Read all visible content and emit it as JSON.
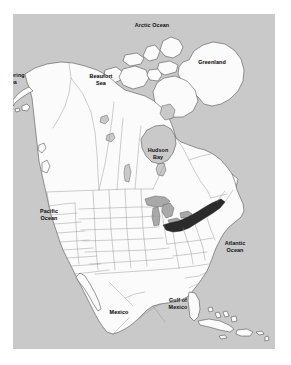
{
  "figure": {
    "kind": "reference-map",
    "highlight_region": "New York State"
  },
  "colors": {
    "background": "#c9c9c9",
    "water": "#c9c9c9",
    "land": "#fbfbfb",
    "highlight": "#2b2b2b",
    "outline": "#4a4a4a",
    "border_line": "#8a8a8a",
    "page": "#ffffff",
    "label_text": "#101010"
  },
  "labels": [
    {
      "id": "arctic-ocean",
      "text": "Arctic Ocean",
      "x": 139,
      "y": 8,
      "clip": false
    },
    {
      "id": "greenland",
      "text": "Greenland",
      "x": 199,
      "y": 45,
      "clip": false
    },
    {
      "id": "beaufort-sea",
      "text": "Beaufort\nSea",
      "x": 88,
      "y": 59,
      "clip": false
    },
    {
      "id": "bering-sea",
      "text": "Bering\nSea",
      "x": -6,
      "y": 58,
      "clip": true
    },
    {
      "id": "hudson-bay",
      "text": "Hudson\nBay",
      "x": 145,
      "y": 133,
      "clip": false
    },
    {
      "id": "pacific-ocean",
      "text": "Pacific\nOcean",
      "x": 36,
      "y": 194,
      "clip": false
    },
    {
      "id": "atlantic-ocean",
      "text": "Atlantic\nOcean",
      "x": 222,
      "y": 226,
      "clip": false
    },
    {
      "id": "gulf-of-mexico",
      "text": "Gulf of\nMexico",
      "x": 165,
      "y": 283,
      "clip": false
    },
    {
      "id": "mexico",
      "text": "Mexico",
      "x": 106,
      "y": 295,
      "clip": false
    }
  ]
}
